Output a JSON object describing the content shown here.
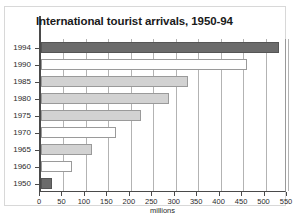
{
  "chart_data": {
    "type": "bar",
    "orientation": "horizontal",
    "title": "International tourist arrivals, 1950-94",
    "xlabel": "millions",
    "ylabel": "",
    "xlim": [
      0,
      550
    ],
    "xticks": [
      0,
      50,
      100,
      150,
      200,
      250,
      300,
      350,
      400,
      450,
      500,
      550
    ],
    "grid": "vertical",
    "legend": "none",
    "categories": [
      "1994",
      "1990",
      "1985",
      "1980",
      "1975",
      "1970",
      "1965",
      "1960",
      "1950"
    ],
    "values": [
      530,
      458,
      327,
      285,
      222,
      166,
      113,
      69,
      25
    ],
    "bar_styles": [
      "dark",
      "white",
      "light",
      "light",
      "light",
      "white",
      "light",
      "white",
      "dark"
    ],
    "colors": {
      "dark": "#6b6b6b",
      "light": "#d2d2d2",
      "white": "#ffffff",
      "axis": "#4a4a4a",
      "grid": "#b3b3b3"
    }
  }
}
